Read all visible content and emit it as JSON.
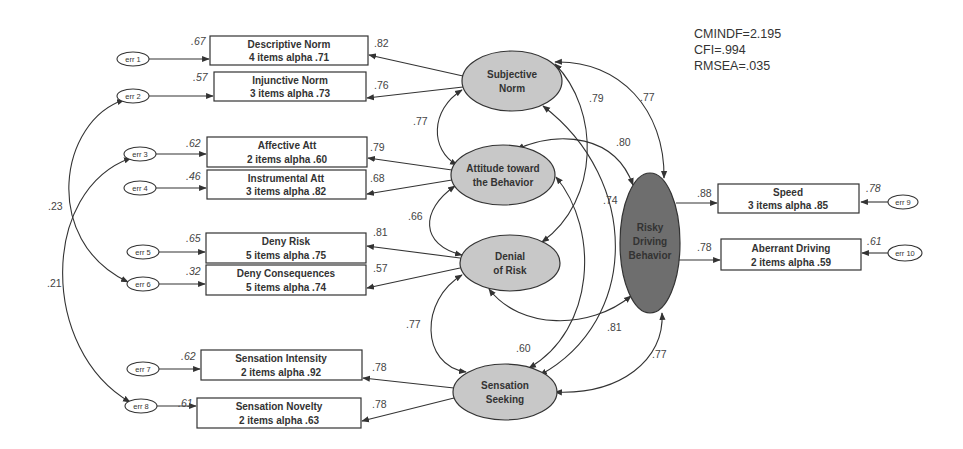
{
  "fit_indices": {
    "cmindf": "CMINDF=2.195",
    "cfi": "CFI=.994",
    "rmsea": "RMSEA=.035"
  },
  "latents": {
    "subjective_norm": [
      "Subjective",
      "Norm"
    ],
    "attitude": [
      "Attitude toward",
      "the Behavior"
    ],
    "denial": [
      "Denial",
      "of Risk"
    ],
    "sensation": [
      "Sensation",
      "Seeking"
    ],
    "risky": [
      "Risky",
      "Driving",
      "Behavior"
    ]
  },
  "indicators": [
    {
      "title": "Descriptive Norm",
      "sub": "4 items alpha .71",
      "err": "err 1",
      "r2": ".67",
      "loading": ".82"
    },
    {
      "title": "Injunctive Norm",
      "sub": "3 items alpha .73",
      "err": "err 2",
      "r2": ".57",
      "loading": ".76"
    },
    {
      "title": "Affective Att",
      "sub": "2 items alpha .60",
      "err": "err 3",
      "r2": ".62",
      "loading": ".79"
    },
    {
      "title": "Instrumental Att",
      "sub": "3 items alpha .82",
      "err": "err 4",
      "r2": ".46",
      "loading": ".68"
    },
    {
      "title": "Deny Risk",
      "sub": "5 items alpha .75",
      "err": "err 5",
      "r2": ".65",
      "loading": ".81"
    },
    {
      "title": "Deny Consequences",
      "sub": "5 items alpha .74",
      "err": "err 6",
      "r2": ".32",
      "loading": ".57"
    },
    {
      "title": "Sensation Intensity",
      "sub": "2 items alpha .92",
      "err": "err 7",
      "r2": ".62",
      "loading": ".78"
    },
    {
      "title": "Sensation Novelty",
      "sub": "2 items alpha .63",
      "err": "err 8",
      "r2": ".61",
      "loading": ".78"
    },
    {
      "title": "Speed",
      "sub": "3 items alpha .85",
      "err": "err 9",
      "r2": ".78",
      "loading": ".88"
    },
    {
      "title": "Aberrant Driving",
      "sub": "2 items alpha .59",
      "err": "err 10",
      "r2": ".61",
      "loading": ".78"
    }
  ],
  "error_covariances": {
    "err2_err6": ".23",
    "err3_err8": ".21"
  },
  "latent_correlations": {
    "sn_att": ".77",
    "att_den": ".66",
    "den_ss": ".77",
    "sn_den": ".79",
    "sn_ss": ".74",
    "sn_rdb": ".77",
    "att_rdb": ".80",
    "att_ss": ".60",
    "den_rdb": ".81",
    "ss_rdb": ".77"
  }
}
